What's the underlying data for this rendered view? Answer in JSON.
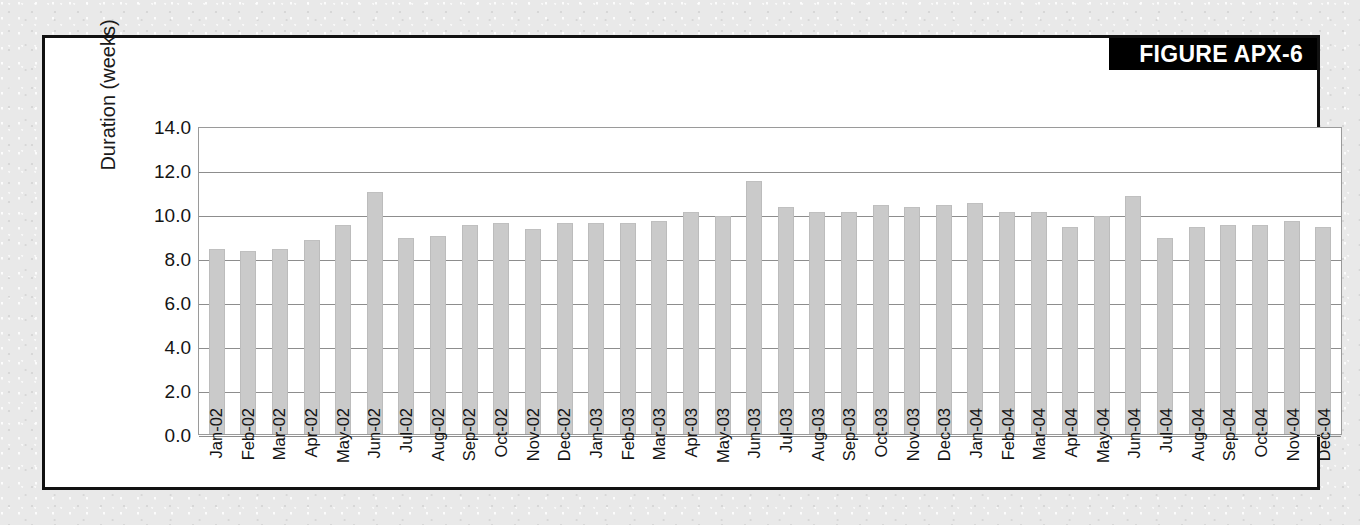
{
  "figure": {
    "badge_label": "FIGURE APX-6"
  },
  "chart_data": {
    "type": "bar",
    "title": "",
    "xlabel": "",
    "ylabel": "Duration (weeks)",
    "ylim": [
      0.0,
      14.0
    ],
    "ytick_labels": [
      "14.0",
      "12.0",
      "10.0",
      "8.0",
      "6.0",
      "4.0",
      "2.0",
      "0.0"
    ],
    "ytick_values": [
      14.0,
      12.0,
      10.0,
      8.0,
      6.0,
      4.0,
      2.0,
      0.0
    ],
    "grid": true,
    "legend": "none",
    "bar_color": "#cacaca",
    "categories": [
      "Jan-02",
      "Feb-02",
      "Mar-02",
      "Apr-02",
      "May-02",
      "Jun-02",
      "Jul-02",
      "Aug-02",
      "Sep-02",
      "Oct-02",
      "Nov-02",
      "Dec-02",
      "Jan-03",
      "Feb-03",
      "Mar-03",
      "Apr-03",
      "May-03",
      "Jun-03",
      "Jul-03",
      "Aug-03",
      "Sep-03",
      "Oct-03",
      "Nov-03",
      "Dec-03",
      "Jan-04",
      "Feb-04",
      "Mar-04",
      "Apr-04",
      "May-04",
      "Jun-04",
      "Jul-04",
      "Aug-04",
      "Sep-04",
      "Oct-04",
      "Nov-04",
      "Dec-04"
    ],
    "values": [
      8.4,
      8.3,
      8.4,
      8.8,
      9.5,
      11.0,
      8.9,
      9.0,
      9.5,
      9.6,
      9.3,
      9.6,
      9.6,
      9.6,
      9.7,
      10.1,
      9.9,
      11.5,
      10.3,
      10.1,
      10.1,
      10.4,
      10.3,
      10.4,
      10.5,
      10.1,
      10.1,
      9.4,
      9.9,
      10.8,
      8.9,
      9.4,
      9.5,
      9.5,
      9.7,
      9.4
    ]
  }
}
